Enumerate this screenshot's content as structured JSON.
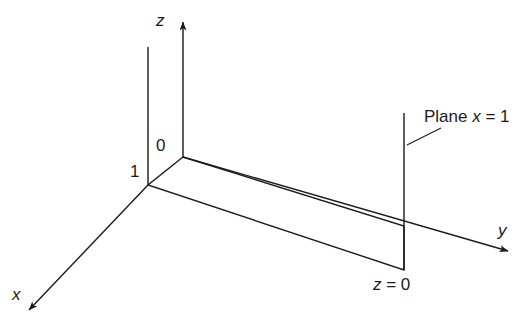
{
  "figure": {
    "type": "3d-coordinate-diagram",
    "background_color": "#ffffff",
    "line_color": "#1b1b1b",
    "text_color": "#1b1b1b"
  },
  "axes": {
    "z": {
      "label": "z",
      "italic": true,
      "arrow": "up",
      "tip": [
        183,
        17
      ],
      "origin": [
        183,
        157
      ]
    },
    "y": {
      "label": "y",
      "italic": true,
      "arrow": "right-down",
      "tip": [
        515,
        254
      ],
      "origin": [
        183,
        157
      ]
    },
    "x": {
      "label": "x",
      "italic": true,
      "arrow": "left-down",
      "tip": [
        22,
        316
      ],
      "origin": [
        148,
        185
      ]
    }
  },
  "tick_labels": [
    {
      "name": "origin-zero",
      "text": "0",
      "at": [
        183,
        157
      ]
    },
    {
      "name": "x-one",
      "text": "1",
      "at": [
        148,
        185
      ]
    }
  ],
  "annotations": [
    {
      "name": "plane-x-equals-1",
      "text_parts": [
        "Plane ",
        "x",
        " = 1"
      ],
      "text": "Plane x = 1",
      "leader_from": [
        408,
        144
      ],
      "leader_to": [
        440,
        129
      ]
    },
    {
      "name": "z-equals-0",
      "text_parts": [
        "z",
        " = 0"
      ],
      "text": "z = 0",
      "at": [
        375,
        278
      ]
    }
  ],
  "shapes": {
    "plane_parallelogram": {
      "name": "plane-x-equals-1-parallelogram",
      "points": [
        [
          183,
          157
        ],
        [
          148,
          185
        ],
        [
          404,
          270
        ],
        [
          404,
          226
        ]
      ],
      "fill": "none",
      "stroke": "#1b1b1b"
    },
    "left_vertical_edge": {
      "from": [
        148,
        47
      ],
      "to": [
        148,
        185
      ]
    },
    "right_vertical_edge": {
      "from": [
        404,
        113
      ],
      "to": [
        404,
        270
      ]
    }
  }
}
